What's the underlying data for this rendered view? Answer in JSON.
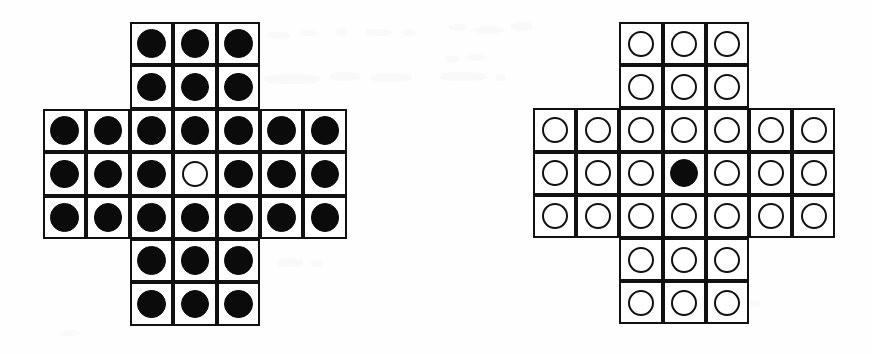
{
  "figure": {
    "type": "peg-solitaire-diagram",
    "background_color": "#ffffff",
    "line_color": "#111111",
    "peg_fill_color": "#0b0b0b",
    "hole_fill_color": "#ffffff",
    "board_shape": "english-cross-33",
    "boards": [
      {
        "id": "board-left",
        "label": "left-board-start-position",
        "x": 43,
        "y": 22,
        "cell_size": 43.4,
        "rows": 7,
        "cols": 7,
        "filled_count": 32,
        "empty_count": 1,
        "empty_positions": [
          [
            3,
            3
          ]
        ],
        "layout": [
          [
            null,
            null,
            "filled",
            "filled",
            "filled",
            null,
            null
          ],
          [
            null,
            null,
            "filled",
            "filled",
            "filled",
            null,
            null
          ],
          [
            "filled",
            "filled",
            "filled",
            "filled",
            "filled",
            "filled",
            "filled"
          ],
          [
            "filled",
            "filled",
            "filled",
            "empty",
            "filled",
            "filled",
            "filled"
          ],
          [
            "filled",
            "filled",
            "filled",
            "filled",
            "filled",
            "filled",
            "filled"
          ],
          [
            null,
            null,
            "filled",
            "filled",
            "filled",
            null,
            null
          ],
          [
            null,
            null,
            "filled",
            "filled",
            "filled",
            null,
            null
          ]
        ]
      },
      {
        "id": "board-right",
        "label": "right-board-final-position",
        "x": 533,
        "y": 22,
        "cell_size": 43.2,
        "rows": 7,
        "cols": 7,
        "filled_count": 1,
        "empty_count": 32,
        "filled_positions": [
          [
            3,
            3
          ]
        ],
        "layout": [
          [
            null,
            null,
            "empty",
            "empty",
            "empty",
            null,
            null
          ],
          [
            null,
            null,
            "empty",
            "empty",
            "empty",
            null,
            null
          ],
          [
            "empty",
            "empty",
            "empty",
            "empty",
            "empty",
            "empty",
            "empty"
          ],
          [
            "empty",
            "empty",
            "empty",
            "filled",
            "empty",
            "empty",
            "empty"
          ],
          [
            "empty",
            "empty",
            "empty",
            "empty",
            "empty",
            "empty",
            "empty"
          ],
          [
            null,
            null,
            "empty",
            "empty",
            "empty",
            null,
            null
          ],
          [
            null,
            null,
            "empty",
            "empty",
            "empty",
            null,
            null
          ]
        ]
      }
    ],
    "ghost_marks": [
      {
        "x": 268,
        "y": 32,
        "w": 22,
        "h": 7,
        "o": 0.5
      },
      {
        "x": 300,
        "y": 30,
        "w": 18,
        "h": 6,
        "o": 0.45
      },
      {
        "x": 336,
        "y": 28,
        "w": 12,
        "h": 8,
        "o": 0.4
      },
      {
        "x": 366,
        "y": 29,
        "w": 26,
        "h": 7,
        "o": 0.45
      },
      {
        "x": 402,
        "y": 30,
        "w": 14,
        "h": 6,
        "o": 0.4
      },
      {
        "x": 264,
        "y": 74,
        "w": 56,
        "h": 10,
        "o": 0.5
      },
      {
        "x": 330,
        "y": 72,
        "w": 30,
        "h": 9,
        "o": 0.45
      },
      {
        "x": 370,
        "y": 73,
        "w": 42,
        "h": 9,
        "o": 0.45
      },
      {
        "x": 449,
        "y": 24,
        "w": 18,
        "h": 7,
        "o": 0.45
      },
      {
        "x": 474,
        "y": 26,
        "w": 30,
        "h": 8,
        "o": 0.45
      },
      {
        "x": 511,
        "y": 22,
        "w": 22,
        "h": 9,
        "o": 0.4
      },
      {
        "x": 445,
        "y": 56,
        "w": 14,
        "h": 7,
        "o": 0.4
      },
      {
        "x": 466,
        "y": 54,
        "w": 20,
        "h": 7,
        "o": 0.4
      },
      {
        "x": 440,
        "y": 72,
        "w": 46,
        "h": 9,
        "o": 0.45
      },
      {
        "x": 496,
        "y": 74,
        "w": 10,
        "h": 7,
        "o": 0.35
      },
      {
        "x": 277,
        "y": 258,
        "w": 26,
        "h": 9,
        "o": 0.45
      },
      {
        "x": 311,
        "y": 260,
        "w": 12,
        "h": 7,
        "o": 0.4
      },
      {
        "x": 745,
        "y": 300,
        "w": 16,
        "h": 7,
        "o": 0.35
      },
      {
        "x": 60,
        "y": 330,
        "w": 20,
        "h": 6,
        "o": 0.3
      }
    ]
  }
}
